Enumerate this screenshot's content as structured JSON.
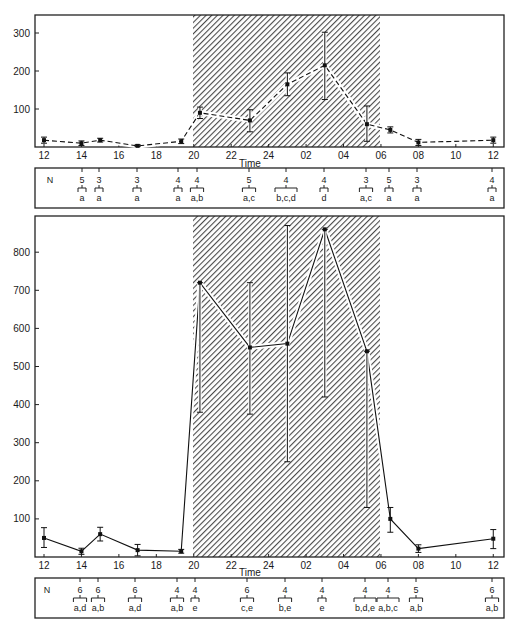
{
  "chart_data": [
    {
      "type": "line",
      "panel": "top",
      "title": "",
      "xlabel": "Time",
      "ylabel": "",
      "ylim": [
        0,
        340
      ],
      "yticks": [
        100,
        200,
        300
      ],
      "xtick_labels": [
        "12",
        "14",
        "16",
        "18",
        "20",
        "22",
        "24",
        "02",
        "04",
        "06",
        "08",
        "10",
        "12"
      ],
      "shaded_region": {
        "from": "20",
        "to": "06",
        "meaning": "dark period (hatched)"
      },
      "line_style": "dashed",
      "grid": false,
      "series": [
        {
          "name": "top",
          "points": [
            {
              "t": 12.0,
              "label": "12",
              "value": 18,
              "err_low": 10,
              "err_high": 26,
              "N": "5",
              "sig": "a",
              "n_hidden": true
            },
            {
              "t": 14.0,
              "label": "14",
              "value": 10,
              "err_low": 4,
              "err_high": 16,
              "N": "5",
              "sig": "a"
            },
            {
              "t": 15.0,
              "label": "15",
              "value": 18,
              "err_low": 13,
              "err_high": 23,
              "N": "3",
              "sig": "a"
            },
            {
              "t": 17.0,
              "label": "17",
              "value": 3,
              "err_low": 1,
              "err_high": 6,
              "N": "3",
              "sig": "a"
            },
            {
              "t": 19.33,
              "label": "19:20",
              "value": 15,
              "err_low": 9,
              "err_high": 21,
              "N": "4",
              "sig": "a"
            },
            {
              "t": 20.33,
              "label": "20:20",
              "value": 90,
              "err_low": 75,
              "err_high": 105,
              "N": "4",
              "sig": "a,b"
            },
            {
              "t": 23.0,
              "label": "23",
              "value": 70,
              "err_low": 40,
              "err_high": 98,
              "N": "5",
              "sig": "a,c"
            },
            {
              "t": 25.0,
              "label": "01",
              "value": 165,
              "err_low": 135,
              "err_high": 195,
              "N": "4",
              "sig": "b,c,d"
            },
            {
              "t": 27.0,
              "label": "03",
              "value": 215,
              "err_low": 125,
              "err_high": 302,
              "N": "4",
              "sig": "d"
            },
            {
              "t": 29.25,
              "label": "05:15",
              "value": 60,
              "err_low": 15,
              "err_high": 108,
              "N": "3",
              "sig": "a,c"
            },
            {
              "t": 30.5,
              "label": "06:30",
              "value": 45,
              "err_low": 37,
              "err_high": 53,
              "N": "5",
              "sig": "a"
            },
            {
              "t": 32.0,
              "label": "08",
              "value": 12,
              "err_low": 4,
              "err_high": 20,
              "N": "3",
              "sig": "a"
            },
            {
              "t": 36.0,
              "label": "12",
              "value": 18,
              "err_low": 10,
              "err_high": 26,
              "N": "4",
              "sig": "a"
            }
          ]
        }
      ]
    },
    {
      "type": "line",
      "panel": "bottom",
      "title": "",
      "xlabel": "Time",
      "ylabel": "",
      "ylim": [
        0,
        880
      ],
      "yticks": [
        100,
        200,
        300,
        400,
        500,
        600,
        700,
        800
      ],
      "xtick_labels": [
        "12",
        "14",
        "16",
        "18",
        "20",
        "22",
        "24",
        "02",
        "04",
        "06",
        "08",
        "10",
        "12"
      ],
      "shaded_region": {
        "from": "20",
        "to": "06",
        "meaning": "dark period (hatched)"
      },
      "line_style": "solid",
      "grid": false,
      "series": [
        {
          "name": "bottom",
          "points": [
            {
              "t": 12.0,
              "label": "12",
              "value": 50,
              "err_low": 25,
              "err_high": 77
            },
            {
              "t": 14.0,
              "label": "14",
              "value": 15,
              "err_low": 7,
              "err_high": 23,
              "N": "6",
              "sig": "a,d"
            },
            {
              "t": 15.0,
              "label": "15",
              "value": 60,
              "err_low": 42,
              "err_high": 78,
              "N": "6",
              "sig": "a,b"
            },
            {
              "t": 17.0,
              "label": "17",
              "value": 18,
              "err_low": 3,
              "err_high": 33,
              "N": "6",
              "sig": "a,d"
            },
            {
              "t": 19.33,
              "label": "19:20",
              "value": 15,
              "err_low": 10,
              "err_high": 20,
              "N": "4",
              "sig": "a,b"
            },
            {
              "t": 20.33,
              "label": "20:20",
              "value": 720,
              "err_low": 380,
              "err_high": 720,
              "N": "4",
              "sig": "e"
            },
            {
              "t": 23.0,
              "label": "23",
              "value": 550,
              "err_low": 375,
              "err_high": 720,
              "N": "6",
              "sig": "c,e"
            },
            {
              "t": 25.0,
              "label": "01",
              "value": 560,
              "err_low": 250,
              "err_high": 870,
              "N": "4",
              "sig": "b,e"
            },
            {
              "t": 27.0,
              "label": "03",
              "value": 860,
              "err_low": 420,
              "err_high": 860,
              "N": "4",
              "sig": "e"
            },
            {
              "t": 29.25,
              "label": "05:15",
              "value": 540,
              "err_low": 130,
              "err_high": 540,
              "N": "4",
              "sig": "b,d,e"
            },
            {
              "t": 30.5,
              "label": "06:30",
              "value": 100,
              "err_low": 65,
              "err_high": 130,
              "N": "4",
              "sig": "a,b,c"
            },
            {
              "t": 32.0,
              "label": "08",
              "value": 22,
              "err_low": 12,
              "err_high": 32,
              "N": "5",
              "sig": "a,b"
            },
            {
              "t": 36.0,
              "label": "12",
              "value": 48,
              "err_low": 22,
              "err_high": 72,
              "N": "6",
              "sig": "a,b"
            }
          ]
        }
      ]
    }
  ],
  "labels": {
    "time_axis": "Time",
    "n_row_label": "N",
    "y_top_ticks": [
      "100",
      "200",
      "300"
    ],
    "y_bottom_ticks": [
      "100",
      "200",
      "300",
      "400",
      "500",
      "600",
      "700",
      "800"
    ],
    "x_ticks": [
      "12",
      "14",
      "16",
      "18",
      "20",
      "22",
      "24",
      "02",
      "04",
      "06",
      "08",
      "10",
      "12"
    ]
  },
  "top_n_table": [
    {
      "N": "5",
      "sig": "a",
      "x": 82
    },
    {
      "N": "3",
      "sig": "a",
      "x": 99
    },
    {
      "N": "3",
      "sig": "a",
      "x": 137
    },
    {
      "N": "4",
      "sig": "a",
      "x": 178
    },
    {
      "N": "4",
      "sig": "a,b",
      "x": 197
    },
    {
      "N": "5",
      "sig": "a,c",
      "x": 249
    },
    {
      "N": "4",
      "sig": "b,c,d",
      "x": 286
    },
    {
      "N": "4",
      "sig": "d",
      "x": 324
    },
    {
      "N": "3",
      "sig": "a,c",
      "x": 366
    },
    {
      "N": "5",
      "sig": "a",
      "x": 389
    },
    {
      "N": "3",
      "sig": "a",
      "x": 417
    },
    {
      "N": "4",
      "sig": "a",
      "x": 492
    }
  ],
  "bottom_n_table": [
    {
      "N": "6",
      "sig": "a,d",
      "x": 80
    },
    {
      "N": "6",
      "sig": "a,b",
      "x": 98
    },
    {
      "N": "6",
      "sig": "a,d",
      "x": 135
    },
    {
      "N": "4",
      "sig": "a,b",
      "x": 177
    },
    {
      "N": "4",
      "sig": "e",
      "x": 195
    },
    {
      "N": "6",
      "sig": "c,e",
      "x": 247
    },
    {
      "N": "4",
      "sig": "b,e",
      "x": 285
    },
    {
      "N": "4",
      "sig": "e",
      "x": 322
    },
    {
      "N": "4",
      "sig": "b,d,e",
      "x": 365
    },
    {
      "N": "4",
      "sig": "a,b,c",
      "x": 388
    },
    {
      "N": "5",
      "sig": "a,b",
      "x": 416
    },
    {
      "N": "6",
      "sig": "a,b",
      "x": 492
    }
  ]
}
